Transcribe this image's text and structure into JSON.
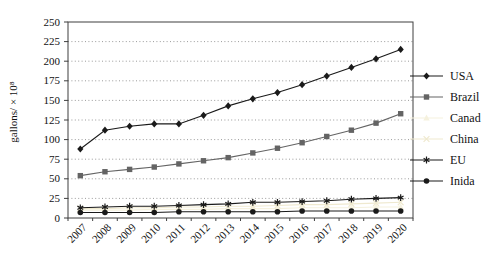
{
  "chart_data": {
    "type": "line",
    "title": "",
    "xlabel": "",
    "ylabel": "gallons/ × 10⁸",
    "ylim": [
      0,
      250
    ],
    "ytick_step": 25,
    "grid": "horizontal-dotted",
    "legend_position": "right",
    "axis_color": "#3f3f3f",
    "gridline_color": "#909090",
    "categories": [
      "2007",
      "2008",
      "2009",
      "2010",
      "2011",
      "2012",
      "2013",
      "2014",
      "2015",
      "2016",
      "2017",
      "2018",
      "2019",
      "2020"
    ],
    "series": [
      {
        "name": "USA",
        "marker": "diamond",
        "color": "#1a1a1a",
        "values": [
          88,
          112,
          117,
          120,
          120,
          131,
          143,
          152,
          160,
          170,
          181,
          192,
          203,
          215
        ]
      },
      {
        "name": "Brazil",
        "marker": "square",
        "color": "#646464",
        "values": [
          54,
          59,
          62,
          65,
          69,
          73,
          77,
          83,
          89,
          96,
          104,
          112,
          121,
          133
        ]
      },
      {
        "name": "Canad",
        "marker": "triangle",
        "color": "#f5f1de",
        "values": [
          10,
          10,
          10,
          11,
          11,
          11,
          12,
          12,
          12,
          13,
          13,
          13,
          14,
          14
        ]
      },
      {
        "name": "China",
        "marker": "x",
        "color": "#efe9cf",
        "values": [
          12,
          12,
          13,
          13,
          14,
          14,
          15,
          15,
          16,
          17,
          17,
          18,
          19,
          20
        ]
      },
      {
        "name": "EU",
        "marker": "asterisk",
        "color": "#1a1a1a",
        "values": [
          13,
          14,
          15,
          15,
          16,
          17,
          18,
          20,
          20,
          21,
          22,
          24,
          25,
          26
        ]
      },
      {
        "name": "Inida",
        "marker": "circle",
        "color": "#1a1a1a",
        "values": [
          7,
          7,
          7,
          7,
          8,
          8,
          8,
          8,
          8,
          9,
          9,
          9,
          9,
          9
        ]
      }
    ]
  }
}
